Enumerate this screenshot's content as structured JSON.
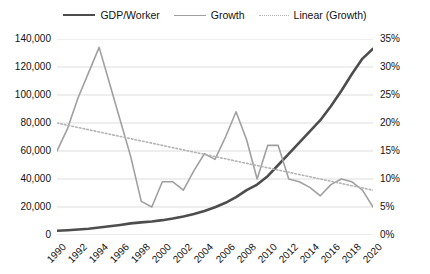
{
  "legend": {
    "position": "top-center",
    "items": [
      {
        "label": "GDP/Worker",
        "style": "solid-thick",
        "color": "#4d4d4d"
      },
      {
        "label": "Growth",
        "style": "solid-thin",
        "color": "#a0a0a0"
      },
      {
        "label": "Linear (Growth)",
        "style": "dotted",
        "color": "#b4b4b4"
      }
    ]
  },
  "chart_data": {
    "type": "line",
    "title": "",
    "xlabel": "",
    "ylabel": "",
    "y2label": "",
    "grid": true,
    "x": [
      1990,
      1991,
      1992,
      1993,
      1994,
      1995,
      1996,
      1997,
      1998,
      1999,
      2000,
      2001,
      2002,
      2003,
      2004,
      2005,
      2006,
      2007,
      2008,
      2009,
      2010,
      2011,
      2012,
      2013,
      2014,
      2015,
      2016,
      2017,
      2018,
      2019,
      2020
    ],
    "xtick_labels": [
      "1990",
      "1992",
      "1994",
      "1996",
      "1998",
      "2000",
      "2002",
      "2004",
      "2006",
      "2008",
      "2010",
      "2012",
      "2014",
      "2016",
      "2018",
      "2020"
    ],
    "ylim": [
      0,
      140000
    ],
    "ytick_labels": [
      "0",
      "20,000",
      "40,000",
      "60,000",
      "80,000",
      "100,000",
      "120,000",
      "140,000"
    ],
    "ytick_values": [
      0,
      20000,
      40000,
      60000,
      80000,
      100000,
      120000,
      140000
    ],
    "y2lim": [
      0,
      35
    ],
    "y2tick_labels": [
      "0%",
      "5%",
      "10%",
      "15%",
      "20%",
      "25%",
      "30%",
      "35%"
    ],
    "y2tick_values": [
      0,
      5,
      10,
      15,
      20,
      25,
      30,
      35
    ],
    "series": [
      {
        "name": "GDP/Worker",
        "axis": "left",
        "color": "#4d4d4d",
        "width": 2.6,
        "dash": "none",
        "values": [
          3000,
          3400,
          3900,
          4500,
          5300,
          6200,
          7200,
          8300,
          9000,
          9600,
          10600,
          11800,
          13200,
          15000,
          17200,
          19800,
          23000,
          27000,
          32000,
          36000,
          42000,
          50000,
          58000,
          66000,
          74000,
          82000,
          92000,
          103000,
          115000,
          126000,
          133000
        ]
      },
      {
        "name": "Growth",
        "axis": "right",
        "color": "#a0a0a0",
        "width": 1.6,
        "dash": "none",
        "values": [
          15.0,
          19.0,
          24.5,
          29.0,
          33.5,
          27.0,
          20.5,
          14.0,
          6.0,
          5.0,
          9.5,
          9.5,
          8.0,
          11.5,
          14.5,
          13.5,
          17.5,
          22.0,
          17.0,
          10.0,
          16.0,
          16.0,
          10.0,
          9.5,
          8.5,
          7.0,
          9.0,
          10.0,
          9.5,
          8.0,
          5.0
        ]
      },
      {
        "name": "Linear (Growth)",
        "axis": "right",
        "color": "#b4b4b4",
        "width": 1.6,
        "dash": "dotted",
        "trend": true,
        "values": [
          20.0,
          19.6,
          19.2,
          18.8,
          18.4,
          18.0,
          17.6,
          17.2,
          16.8,
          16.4,
          16.0,
          15.6,
          15.2,
          14.8,
          14.4,
          14.0,
          13.6,
          13.2,
          12.8,
          12.4,
          12.0,
          11.6,
          11.2,
          10.8,
          10.4,
          10.0,
          9.6,
          9.2,
          8.8,
          8.4,
          8.0
        ]
      }
    ]
  },
  "style": {
    "background": "#ffffff",
    "grid_color": "#d9d9d9",
    "text_color": "#111111"
  }
}
